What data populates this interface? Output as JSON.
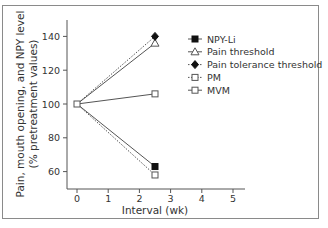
{
  "chart_data": {
    "type": "line",
    "title": "",
    "xlabel": "Interval (wk)",
    "ylabel": "Pain, mouth opening, and NPY level (% pretreatment values)",
    "ylabel_lines": [
      "Pain, mouth opening, and NPY level",
      "(% pretreatment values)"
    ],
    "xlim": [
      0,
      5
    ],
    "ylim": [
      50,
      150
    ],
    "x_ticks": [
      "0",
      "1",
      "2",
      "3",
      "4",
      "5"
    ],
    "y_ticks": [
      "60",
      "80",
      "100",
      "120",
      "140"
    ],
    "grid": false,
    "legend_position": "upper right",
    "x": [
      0,
      2.5
    ],
    "series": [
      {
        "name": "NPY-Li",
        "values": [
          100,
          63
        ],
        "marker": "filled-square",
        "line": "solid"
      },
      {
        "name": "Pain threshold",
        "values": [
          100,
          136
        ],
        "marker": "open-triangle",
        "line": "solid"
      },
      {
        "name": "Pain tolerance threshold",
        "values": [
          100,
          140
        ],
        "marker": "filled-diamond",
        "line": "dotted"
      },
      {
        "name": "PM",
        "values": [
          100,
          58
        ],
        "marker": "open-square",
        "line": "dotted"
      },
      {
        "name": "MVM",
        "values": [
          100,
          106
        ],
        "marker": "open-square",
        "line": "solid"
      }
    ]
  },
  "colors": {
    "line": "#555555",
    "frame": "#8a8a8a",
    "text": "#333333"
  }
}
